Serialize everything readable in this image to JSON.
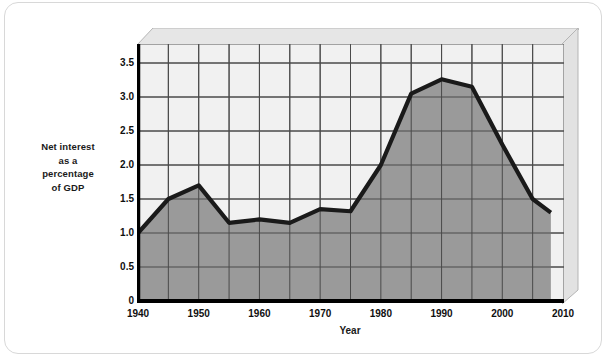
{
  "chart_data": {
    "type": "area",
    "title": "",
    "subtitle": "",
    "xlabel": "Year",
    "ylabel": "Net interest as a percentage of GDP",
    "ylabel_lines": [
      "Net interest",
      "as a",
      "percentage",
      "of GDP"
    ],
    "xlim": [
      1940,
      2010
    ],
    "ylim": [
      0,
      3.75
    ],
    "xticks": [
      1940,
      1950,
      1960,
      1970,
      1980,
      1990,
      2000,
      2010
    ],
    "xtick_labels": [
      "1940",
      "1950",
      "1960",
      "1970",
      "1980",
      "1990",
      "2000",
      "2010"
    ],
    "yticks": [
      0,
      0.5,
      1.0,
      1.5,
      2.0,
      2.5,
      3.0,
      3.5
    ],
    "ytick_labels": [
      "0",
      "0.5",
      "1.0",
      "1.5",
      "2.0",
      "2.5",
      "3.0",
      "3.5"
    ],
    "grid": true,
    "grid_x_step": 5,
    "grid_y_step": 0.5,
    "legend": "none",
    "x": [
      1940,
      1945,
      1950,
      1955,
      1960,
      1965,
      1970,
      1975,
      1980,
      1985,
      1990,
      1995,
      2000,
      2005,
      2008
    ],
    "values": [
      1.0,
      1.5,
      1.7,
      1.15,
      1.2,
      1.15,
      1.35,
      1.32,
      2.0,
      3.05,
      3.26,
      3.15,
      2.3,
      1.5,
      1.3
    ],
    "series": [
      {
        "name": "Net interest as a percentage of GDP",
        "values": [
          1.0,
          1.5,
          1.7,
          1.15,
          1.2,
          1.15,
          1.35,
          1.32,
          2.0,
          3.05,
          3.26,
          3.15,
          2.3,
          1.5,
          1.3
        ]
      }
    ]
  },
  "colors": {
    "area_fill": "#9a9a9a",
    "line_stroke": "#1a1a1a",
    "plot_background": "#f1f1f1",
    "grid_line": "#4a4a4a",
    "axis_line": "#000000",
    "bevel_top": "#e4e4e4",
    "bevel_right": "#e0e0e0",
    "card_border": "#d8d8d8",
    "text": "#101010"
  }
}
